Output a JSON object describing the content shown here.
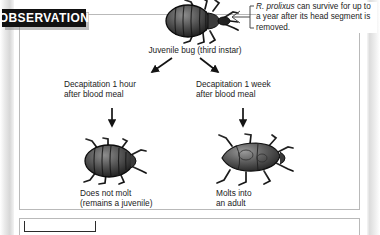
{
  "banner": {
    "label": "OBSERVATION"
  },
  "callout": {
    "species": "R. prolixus",
    "text": " can survive for up to a year after its head segment is removed."
  },
  "diagram": {
    "type": "flowchart",
    "top_node": {
      "icon": "juvenile-bug-illustration",
      "caption": "Juvenile bug (third instar)"
    },
    "branches": [
      {
        "condition": "Decapitation 1 hour\nafter blood meal",
        "icon": "headless-juvenile-bug-illustration",
        "outcome": "Does not molt\n(remains a juvenile)"
      },
      {
        "condition": "Decapitation 1 week\nafter blood meal",
        "icon": "headless-adult-bug-illustration",
        "outcome": "Molts into\nan adult"
      }
    ]
  },
  "colors": {
    "banner_bg": "#111111",
    "banner_text": "#ffffff",
    "panel_border": "#b9b9b9",
    "body_text": "#1b1b1b",
    "bug_dark": "#2a2a2a",
    "bug_mid": "#6b6b6b",
    "bug_light": "#b8b8b8"
  }
}
